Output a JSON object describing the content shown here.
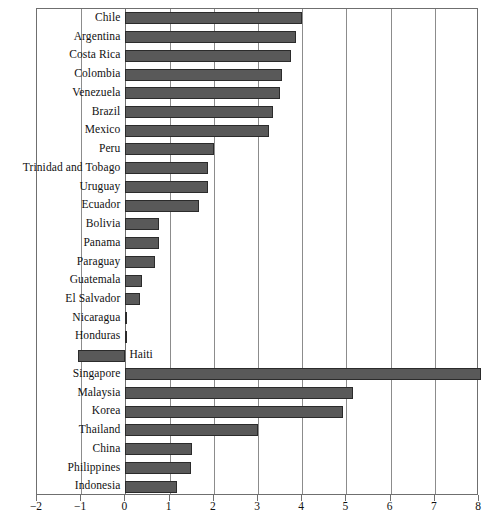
{
  "chart_data": {
    "type": "bar",
    "orientation": "horizontal",
    "title": "",
    "subtitle": "",
    "xlabel": "",
    "ylabel": "",
    "xlim": [
      -2,
      8
    ],
    "xticks": [
      -2,
      -1,
      0,
      1,
      2,
      3,
      4,
      5,
      6,
      7,
      8
    ],
    "xtick_labels": [
      "−2",
      "−1",
      "0",
      "1",
      "2",
      "3",
      "4",
      "5",
      "6",
      "7",
      "8"
    ],
    "grid": "vertical",
    "legend": "none",
    "bar_color": "#595959",
    "bar_edge_color": "#2b2b2b",
    "categories": [
      "Chile",
      "Argentina",
      "Costa Rica",
      "Colombia",
      "Venezuela",
      "Brazil",
      "Mexico",
      "Peru",
      "Trinidad and Tobago",
      "Uruguay",
      "Ecuador",
      "Bolivia",
      "Panama",
      "Paraguay",
      "Guatemala",
      "El Salvador",
      "Nicaragua",
      "Honduras",
      "Haiti",
      "Singapore",
      "Malaysia",
      "Korea",
      "Thailand",
      "China",
      "Philippines",
      "Indonesia"
    ],
    "values": [
      4.0,
      3.85,
      3.74,
      3.54,
      3.49,
      3.34,
      3.26,
      2.0,
      1.88,
      1.88,
      1.67,
      0.77,
      0.75,
      0.66,
      0.38,
      0.34,
      0.03,
      0.03,
      -1.08,
      8.05,
      5.14,
      4.92,
      3.01,
      1.5,
      1.48,
      1.17
    ],
    "label_placement": [
      "left",
      "left",
      "left",
      "left",
      "left",
      "left",
      "left",
      "left",
      "left",
      "left",
      "left",
      "left",
      "left",
      "left",
      "left",
      "left",
      "left",
      "left",
      "right-of-zero",
      "left",
      "left",
      "left",
      "left",
      "left",
      "left",
      "left"
    ]
  }
}
